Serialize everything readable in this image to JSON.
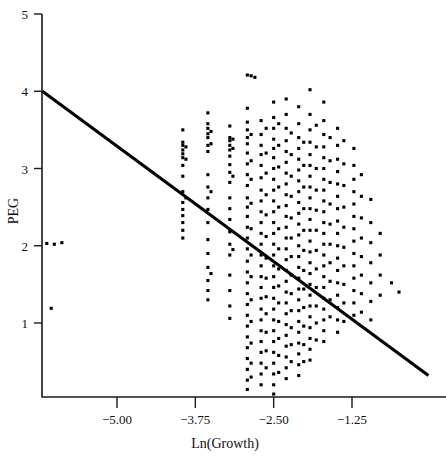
{
  "chart_data": {
    "type": "scatter",
    "title": "",
    "xlabel": "Ln(Growth)",
    "ylabel": "PEG",
    "xlim": [
      -6.45,
      0.15
    ],
    "ylim": [
      0.0,
      5.05
    ],
    "grid": false,
    "legend": null,
    "xticks": [
      -5.0,
      -3.75,
      -2.5,
      -1.25
    ],
    "xticklabels": [
      "−5.00",
      "−3.75",
      "−2.50",
      "−1.25"
    ],
    "yticks": [
      1,
      2,
      3,
      4,
      5
    ],
    "yticklabels": [
      "1",
      "2",
      "3",
      "4",
      "5"
    ],
    "marker": "square",
    "marker_size_px": 3.1,
    "marker_color": "#000000",
    "fit_line": {
      "label": "regression line",
      "color": "#000000",
      "x_start": -6.19,
      "y_start": 4.0,
      "x_end": -0.03,
      "y_end": 0.32,
      "slope": -0.597,
      "intercept": 0.3
    },
    "points": [
      [
        -6.12,
        2.03
      ],
      [
        -6.0,
        2.02
      ],
      [
        -5.88,
        2.04
      ],
      [
        -6.05,
        1.19
      ],
      [
        -3.95,
        3.5
      ],
      [
        -3.95,
        3.34
      ],
      [
        -3.95,
        3.3
      ],
      [
        -3.95,
        3.24
      ],
      [
        -3.95,
        3.19
      ],
      [
        -3.95,
        3.14
      ],
      [
        -3.95,
        3.04
      ],
      [
        -3.95,
        2.9
      ],
      [
        -3.95,
        2.7
      ],
      [
        -3.95,
        2.56
      ],
      [
        -3.95,
        2.47
      ],
      [
        -3.95,
        2.39
      ],
      [
        -3.95,
        2.3
      ],
      [
        -3.95,
        2.2
      ],
      [
        -3.95,
        2.1
      ],
      [
        -3.9,
        3.28
      ],
      [
        -3.9,
        3.12
      ],
      [
        -3.9,
        2.62
      ],
      [
        -3.55,
        3.72
      ],
      [
        -3.55,
        3.58
      ],
      [
        -3.55,
        3.52
      ],
      [
        -3.55,
        3.45
      ],
      [
        -3.55,
        3.4
      ],
      [
        -3.55,
        3.3
      ],
      [
        -3.55,
        3.22
      ],
      [
        -3.55,
        2.92
      ],
      [
        -3.55,
        2.76
      ],
      [
        -3.55,
        2.62
      ],
      [
        -3.55,
        2.47
      ],
      [
        -3.55,
        2.3
      ],
      [
        -3.55,
        2.08
      ],
      [
        -3.55,
        1.9
      ],
      [
        -3.55,
        1.72
      ],
      [
        -3.55,
        1.55
      ],
      [
        -3.55,
        1.42
      ],
      [
        -3.55,
        1.3
      ],
      [
        -3.5,
        3.48
      ],
      [
        -3.5,
        3.32
      ],
      [
        -3.5,
        2.7
      ],
      [
        -3.5,
        1.64
      ],
      [
        -3.2,
        3.55
      ],
      [
        -3.2,
        3.4
      ],
      [
        -3.2,
        3.36
      ],
      [
        -3.2,
        3.3
      ],
      [
        -3.2,
        3.24
      ],
      [
        -3.2,
        3.16
      ],
      [
        -3.2,
        3.05
      ],
      [
        -3.2,
        2.95
      ],
      [
        -3.2,
        2.82
      ],
      [
        -3.2,
        2.62
      ],
      [
        -3.2,
        2.48
      ],
      [
        -3.2,
        2.34
      ],
      [
        -3.2,
        2.18
      ],
      [
        -3.2,
        2.02
      ],
      [
        -3.2,
        1.88
      ],
      [
        -3.2,
        1.62
      ],
      [
        -3.2,
        1.42
      ],
      [
        -3.2,
        1.22
      ],
      [
        -3.2,
        1.06
      ],
      [
        -3.15,
        3.38
      ],
      [
        -3.15,
        3.26
      ],
      [
        -3.15,
        2.9
      ],
      [
        -3.15,
        1.95
      ],
      [
        -2.92,
        4.21
      ],
      [
        -2.86,
        4.2
      ],
      [
        -2.8,
        4.18
      ],
      [
        -2.92,
        3.78
      ],
      [
        -2.92,
        3.6
      ],
      [
        -2.92,
        3.5
      ],
      [
        -2.92,
        3.4
      ],
      [
        -2.92,
        3.32
      ],
      [
        -2.92,
        3.2
      ],
      [
        -2.92,
        3.06
      ],
      [
        -2.92,
        2.92
      ],
      [
        -2.92,
        2.78
      ],
      [
        -2.92,
        2.62
      ],
      [
        -2.92,
        2.5
      ],
      [
        -2.92,
        2.38
      ],
      [
        -2.92,
        2.24
      ],
      [
        -2.92,
        2.1
      ],
      [
        -2.92,
        1.96
      ],
      [
        -2.92,
        1.8
      ],
      [
        -2.92,
        1.66
      ],
      [
        -2.92,
        1.52
      ],
      [
        -2.92,
        1.38
      ],
      [
        -2.92,
        1.24
      ],
      [
        -2.92,
        1.1
      ],
      [
        -2.92,
        0.96
      ],
      [
        -2.92,
        0.82
      ],
      [
        -2.92,
        0.68
      ],
      [
        -2.92,
        0.54
      ],
      [
        -2.92,
        0.4
      ],
      [
        -2.92,
        0.26
      ],
      [
        -2.92,
        0.14
      ],
      [
        -2.86,
        3.44
      ],
      [
        -2.86,
        3.1
      ],
      [
        -2.86,
        2.86
      ],
      [
        -2.86,
        2.55
      ],
      [
        -2.86,
        2.22
      ],
      [
        -2.86,
        1.88
      ],
      [
        -2.86,
        1.6
      ],
      [
        -2.86,
        1.3
      ],
      [
        -2.86,
        1.02
      ],
      [
        -2.86,
        0.74
      ],
      [
        -2.86,
        0.48
      ],
      [
        -2.86,
        0.3
      ],
      [
        -2.7,
        3.62
      ],
      [
        -2.7,
        3.44
      ],
      [
        -2.7,
        3.3
      ],
      [
        -2.7,
        3.18
      ],
      [
        -2.7,
        3.04
      ],
      [
        -2.7,
        2.88
      ],
      [
        -2.7,
        2.72
      ],
      [
        -2.7,
        2.58
      ],
      [
        -2.7,
        2.44
      ],
      [
        -2.7,
        2.3
      ],
      [
        -2.7,
        2.16
      ],
      [
        -2.7,
        2.02
      ],
      [
        -2.7,
        1.88
      ],
      [
        -2.7,
        1.74
      ],
      [
        -2.7,
        1.6
      ],
      [
        -2.7,
        1.46
      ],
      [
        -2.7,
        1.32
      ],
      [
        -2.7,
        1.18
      ],
      [
        -2.7,
        1.04
      ],
      [
        -2.7,
        0.9
      ],
      [
        -2.7,
        0.76
      ],
      [
        -2.7,
        0.62
      ],
      [
        -2.7,
        0.48
      ],
      [
        -2.7,
        0.34
      ],
      [
        -2.7,
        0.2
      ],
      [
        -2.62,
        3.52
      ],
      [
        -2.62,
        3.2
      ],
      [
        -2.62,
        2.94
      ],
      [
        -2.62,
        2.66
      ],
      [
        -2.62,
        2.4
      ],
      [
        -2.62,
        2.12
      ],
      [
        -2.62,
        1.84
      ],
      [
        -2.62,
        1.58
      ],
      [
        -2.62,
        1.34
      ],
      [
        -2.62,
        1.12
      ],
      [
        -2.62,
        0.88
      ],
      [
        -2.62,
        0.64
      ],
      [
        -2.62,
        0.42
      ],
      [
        -2.5,
        3.86
      ],
      [
        -2.5,
        3.66
      ],
      [
        -2.5,
        3.52
      ],
      [
        -2.5,
        3.38
      ],
      [
        -2.5,
        3.26
      ],
      [
        -2.5,
        3.14
      ],
      [
        -2.5,
        3.0
      ],
      [
        -2.5,
        2.86
      ],
      [
        -2.5,
        2.72
      ],
      [
        -2.5,
        2.58
      ],
      [
        -2.5,
        2.44
      ],
      [
        -2.5,
        2.3
      ],
      [
        -2.5,
        2.16
      ],
      [
        -2.5,
        2.02
      ],
      [
        -2.5,
        1.88
      ],
      [
        -2.5,
        1.74
      ],
      [
        -2.5,
        1.6
      ],
      [
        -2.5,
        1.46
      ],
      [
        -2.5,
        1.32
      ],
      [
        -2.5,
        1.18
      ],
      [
        -2.5,
        1.04
      ],
      [
        -2.5,
        0.9
      ],
      [
        -2.5,
        0.76
      ],
      [
        -2.5,
        0.62
      ],
      [
        -2.5,
        0.48
      ],
      [
        -2.5,
        0.34
      ],
      [
        -2.5,
        0.2
      ],
      [
        -2.5,
        0.08
      ],
      [
        -2.42,
        3.58
      ],
      [
        -2.42,
        3.3
      ],
      [
        -2.42,
        3.02
      ],
      [
        -2.42,
        2.76
      ],
      [
        -2.42,
        2.5
      ],
      [
        -2.42,
        2.22
      ],
      [
        -2.42,
        1.96
      ],
      [
        -2.42,
        1.7
      ],
      [
        -2.42,
        1.48
      ],
      [
        -2.42,
        1.26
      ],
      [
        -2.42,
        1.02
      ],
      [
        -2.42,
        0.8
      ],
      [
        -2.42,
        0.58
      ],
      [
        -2.42,
        0.36
      ],
      [
        -2.3,
        3.9
      ],
      [
        -2.3,
        3.7
      ],
      [
        -2.3,
        3.52
      ],
      [
        -2.3,
        3.36
      ],
      [
        -2.3,
        3.22
      ],
      [
        -2.3,
        3.08
      ],
      [
        -2.3,
        2.94
      ],
      [
        -2.3,
        2.8
      ],
      [
        -2.3,
        2.66
      ],
      [
        -2.3,
        2.52
      ],
      [
        -2.3,
        2.38
      ],
      [
        -2.3,
        2.24
      ],
      [
        -2.3,
        2.1
      ],
      [
        -2.3,
        1.96
      ],
      [
        -2.3,
        1.82
      ],
      [
        -2.3,
        1.68
      ],
      [
        -2.3,
        1.54
      ],
      [
        -2.3,
        1.4
      ],
      [
        -2.3,
        1.26
      ],
      [
        -2.3,
        1.12
      ],
      [
        -2.3,
        0.98
      ],
      [
        -2.3,
        0.84
      ],
      [
        -2.3,
        0.7
      ],
      [
        -2.3,
        0.56
      ],
      [
        -2.3,
        0.42
      ],
      [
        -2.3,
        0.28
      ],
      [
        -2.22,
        3.46
      ],
      [
        -2.22,
        3.18
      ],
      [
        -2.22,
        2.9
      ],
      [
        -2.22,
        2.64
      ],
      [
        -2.22,
        2.36
      ],
      [
        -2.22,
        2.1
      ],
      [
        -2.22,
        1.86
      ],
      [
        -2.22,
        1.62
      ],
      [
        -2.22,
        1.38
      ],
      [
        -2.22,
        1.16
      ],
      [
        -2.22,
        0.94
      ],
      [
        -2.22,
        0.72
      ],
      [
        -2.22,
        0.5
      ],
      [
        -2.1,
        3.8
      ],
      [
        -2.1,
        3.58
      ],
      [
        -2.1,
        3.4
      ],
      [
        -2.1,
        3.26
      ],
      [
        -2.1,
        3.12
      ],
      [
        -2.1,
        2.98
      ],
      [
        -2.1,
        2.84
      ],
      [
        -2.1,
        2.7
      ],
      [
        -2.1,
        2.56
      ],
      [
        -2.1,
        2.42
      ],
      [
        -2.1,
        2.28
      ],
      [
        -2.1,
        2.14
      ],
      [
        -2.1,
        2.0
      ],
      [
        -2.1,
        1.86
      ],
      [
        -2.1,
        1.72
      ],
      [
        -2.1,
        1.58
      ],
      [
        -2.1,
        1.44
      ],
      [
        -2.1,
        1.3
      ],
      [
        -2.1,
        1.16
      ],
      [
        -2.1,
        1.02
      ],
      [
        -2.1,
        0.88
      ],
      [
        -2.1,
        0.74
      ],
      [
        -2.1,
        0.6
      ],
      [
        -2.1,
        0.46
      ],
      [
        -2.1,
        0.32
      ],
      [
        -2.02,
        3.34
      ],
      [
        -2.02,
        3.04
      ],
      [
        -2.02,
        2.76
      ],
      [
        -2.02,
        2.48
      ],
      [
        -2.02,
        2.2
      ],
      [
        -2.02,
        1.94
      ],
      [
        -2.02,
        1.68
      ],
      [
        -2.02,
        1.44
      ],
      [
        -2.02,
        1.2
      ],
      [
        -2.02,
        0.96
      ],
      [
        -2.02,
        0.72
      ],
      [
        -2.02,
        0.5
      ],
      [
        -1.92,
        4.02
      ],
      [
        -1.92,
        3.7
      ],
      [
        -1.92,
        3.5
      ],
      [
        -1.92,
        3.34
      ],
      [
        -1.92,
        3.18
      ],
      [
        -1.92,
        3.04
      ],
      [
        -1.92,
        2.9
      ],
      [
        -1.92,
        2.76
      ],
      [
        -1.92,
        2.62
      ],
      [
        -1.92,
        2.48
      ],
      [
        -1.92,
        2.34
      ],
      [
        -1.92,
        2.2
      ],
      [
        -1.92,
        2.06
      ],
      [
        -1.92,
        1.92
      ],
      [
        -1.92,
        1.78
      ],
      [
        -1.92,
        1.64
      ],
      [
        -1.92,
        1.5
      ],
      [
        -1.92,
        1.36
      ],
      [
        -1.92,
        1.22
      ],
      [
        -1.92,
        1.08
      ],
      [
        -1.92,
        0.94
      ],
      [
        -1.92,
        0.8
      ],
      [
        -1.92,
        0.66
      ],
      [
        -1.92,
        0.52
      ],
      [
        -1.82,
        3.56
      ],
      [
        -1.82,
        3.28
      ],
      [
        -1.82,
        3.0
      ],
      [
        -1.82,
        2.72
      ],
      [
        -1.82,
        2.46
      ],
      [
        -1.82,
        2.2
      ],
      [
        -1.82,
        1.94
      ],
      [
        -1.82,
        1.7
      ],
      [
        -1.82,
        1.46
      ],
      [
        -1.82,
        1.22
      ],
      [
        -1.82,
        1.0
      ],
      [
        -1.82,
        0.78
      ],
      [
        -1.7,
        3.86
      ],
      [
        -1.7,
        3.62
      ],
      [
        -1.7,
        3.44
      ],
      [
        -1.7,
        3.28
      ],
      [
        -1.7,
        3.14
      ],
      [
        -1.7,
        3.0
      ],
      [
        -1.7,
        2.86
      ],
      [
        -1.7,
        2.72
      ],
      [
        -1.7,
        2.58
      ],
      [
        -1.7,
        2.44
      ],
      [
        -1.7,
        2.3
      ],
      [
        -1.7,
        2.16
      ],
      [
        -1.7,
        2.02
      ],
      [
        -1.7,
        1.88
      ],
      [
        -1.7,
        1.74
      ],
      [
        -1.7,
        1.6
      ],
      [
        -1.7,
        1.46
      ],
      [
        -1.7,
        1.32
      ],
      [
        -1.7,
        1.18
      ],
      [
        -1.7,
        1.04
      ],
      [
        -1.7,
        0.9
      ],
      [
        -1.7,
        0.76
      ],
      [
        -1.6,
        3.4
      ],
      [
        -1.6,
        3.1
      ],
      [
        -1.6,
        2.82
      ],
      [
        -1.6,
        2.54
      ],
      [
        -1.6,
        2.28
      ],
      [
        -1.6,
        2.02
      ],
      [
        -1.6,
        1.78
      ],
      [
        -1.6,
        1.54
      ],
      [
        -1.6,
        1.3
      ],
      [
        -1.6,
        1.08
      ],
      [
        -1.48,
        3.52
      ],
      [
        -1.48,
        3.3
      ],
      [
        -1.48,
        3.12
      ],
      [
        -1.48,
        2.96
      ],
      [
        -1.48,
        2.8
      ],
      [
        -1.48,
        2.64
      ],
      [
        -1.48,
        2.48
      ],
      [
        -1.48,
        2.32
      ],
      [
        -1.48,
        2.16
      ],
      [
        -1.48,
        2.0
      ],
      [
        -1.48,
        1.84
      ],
      [
        -1.48,
        1.68
      ],
      [
        -1.48,
        1.52
      ],
      [
        -1.48,
        1.36
      ],
      [
        -1.48,
        1.2
      ],
      [
        -1.48,
        1.04
      ],
      [
        -1.48,
        0.88
      ],
      [
        -1.38,
        3.36
      ],
      [
        -1.38,
        3.06
      ],
      [
        -1.38,
        2.78
      ],
      [
        -1.38,
        2.5
      ],
      [
        -1.38,
        2.24
      ],
      [
        -1.38,
        1.98
      ],
      [
        -1.38,
        1.74
      ],
      [
        -1.38,
        1.5
      ],
      [
        -1.38,
        1.26
      ],
      [
        -1.38,
        1.02
      ],
      [
        -1.22,
        3.26
      ],
      [
        -1.22,
        3.04
      ],
      [
        -1.22,
        2.86
      ],
      [
        -1.22,
        2.7
      ],
      [
        -1.22,
        2.54
      ],
      [
        -1.22,
        2.38
      ],
      [
        -1.22,
        2.22
      ],
      [
        -1.22,
        2.06
      ],
      [
        -1.22,
        1.9
      ],
      [
        -1.22,
        1.74
      ],
      [
        -1.22,
        1.58
      ],
      [
        -1.22,
        1.42
      ],
      [
        -1.22,
        1.26
      ],
      [
        -1.22,
        1.1
      ],
      [
        -1.1,
        2.92
      ],
      [
        -1.1,
        2.64
      ],
      [
        -1.1,
        2.36
      ],
      [
        -1.1,
        2.1
      ],
      [
        -1.1,
        1.86
      ],
      [
        -1.1,
        1.62
      ],
      [
        -1.1,
        1.38
      ],
      [
        -1.1,
        1.14
      ],
      [
        -0.95,
        2.6
      ],
      [
        -0.95,
        2.3
      ],
      [
        -0.95,
        2.04
      ],
      [
        -0.95,
        1.78
      ],
      [
        -0.95,
        1.52
      ],
      [
        -0.95,
        1.28
      ],
      [
        -0.95,
        1.04
      ],
      [
        -0.8,
        2.16
      ],
      [
        -0.8,
        1.88
      ],
      [
        -0.8,
        1.62
      ],
      [
        -0.8,
        1.36
      ],
      [
        -0.62,
        1.52
      ],
      [
        -0.5,
        1.4
      ]
    ]
  }
}
